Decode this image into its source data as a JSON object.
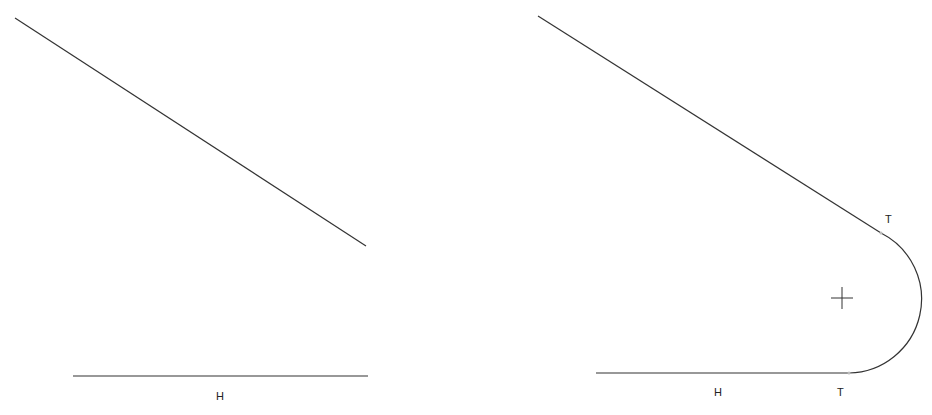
{
  "panels": {
    "before": {
      "diagonal_line": {
        "x1": 15,
        "y1": 18,
        "x2": 366,
        "y2": 246
      },
      "horizontal_line": {
        "x1": 73,
        "y1": 376,
        "x2": 368,
        "y2": 376
      },
      "horizontal_label": {
        "text": "H",
        "x": 216,
        "y": 400
      }
    },
    "after": {
      "diagonal_line": {
        "x1": 538,
        "y1": 16,
        "x2": 881,
        "y2": 233
      },
      "horizontal_line": {
        "x1": 596,
        "y1": 373,
        "x2": 849,
        "y2": 373
      },
      "fillet_arc": {
        "start_x": 881,
        "start_y": 233,
        "end_x": 849,
        "end_y": 373,
        "radius": 74
      },
      "center_marker": {
        "x": 842,
        "y": 298,
        "size": 11
      },
      "horizontal_label": {
        "text": "H",
        "x": 714,
        "y": 396
      },
      "tangent_label_top": {
        "text": "T",
        "x": 885,
        "y": 223
      },
      "tangent_label_bottom": {
        "text": "T",
        "x": 837,
        "y": 396
      }
    }
  },
  "colors": {
    "line": "#333333",
    "background": "#ffffff"
  }
}
